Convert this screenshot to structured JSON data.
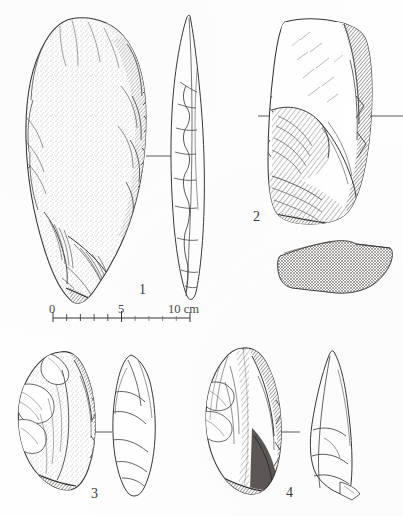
{
  "plate": {
    "type": "archaeological-lithic-illustration",
    "medium": "pen-and-ink line drawing, stipple and hatch shading",
    "background_color": "#fefefe",
    "ink_color": "#3a3a3a",
    "width": 403,
    "height": 516,
    "object_count": 4
  },
  "figures": [
    {
      "id": "figure-1",
      "number": "1",
      "number_x": 142,
      "number_y": 283,
      "description": "large ovate biface / handaxe, plan view with stippled face and flake-scar hatching, plus narrow lenticular profile view",
      "views": [
        "plan",
        "profile"
      ],
      "shading": "stipple"
    },
    {
      "id": "figure-2",
      "number": "2",
      "number_x": 256,
      "number_y": 210,
      "description": "blocky rectangular core / thick flake, plan view with dense oblique hatching, plus flat cross-hatched slab section below",
      "views": [
        "plan",
        "section"
      ],
      "shading": "hatch"
    },
    {
      "id": "figure-3",
      "number": "3",
      "number_x": 93,
      "number_y": 487,
      "description": "small pointed flake, plan view with stipple and hatch, plus narrow profile view",
      "views": [
        "plan",
        "profile"
      ],
      "shading": "stipple-hatch"
    },
    {
      "id": "figure-4",
      "number": "4",
      "number_x": 288,
      "number_y": 486,
      "description": "pointed flake / point with heavily shaded right margin, plan view plus triangular profile view",
      "views": [
        "plan",
        "profile"
      ],
      "shading": "dense-hatch"
    }
  ],
  "scale_bar": {
    "id": "scale-bar",
    "unit": "cm",
    "unit_label": "cm",
    "min": 0,
    "max": 10,
    "major_interval": 5,
    "minor_interval": 1,
    "tick_labels": [
      "0",
      "5",
      "10"
    ],
    "end_label": "10 cm",
    "label_0": "0",
    "label_5": "5",
    "label_10": "10 cm",
    "x_start": 53,
    "x_end": 190,
    "baseline_y": 318,
    "label_y": 305
  }
}
